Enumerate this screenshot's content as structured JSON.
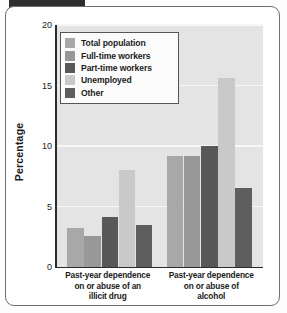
{
  "figure": {
    "frame_border_color": "#6f6f6f",
    "tab_color": "#2e2e2e",
    "plot_background": "#e4e4e4",
    "gridline_color": "#f7f7f7",
    "axis_color": "#2b2b2b"
  },
  "chart_data": {
    "type": "bar",
    "title": "",
    "xlabel": "",
    "ylabel": "Percentage",
    "ylim": [
      0,
      20
    ],
    "yticks": [
      0,
      5,
      10,
      15,
      20
    ],
    "ytick_labels": [
      "0",
      "5",
      "10",
      "15",
      "20"
    ],
    "grid": true,
    "legend_position": "upper left",
    "categories": [
      "Past-year dependence on or abuse of an illicit drug",
      "Past-year dependence on or abuse of alcohol"
    ],
    "category_lines": [
      [
        "Past-year dependence",
        "on or abuse of an",
        "illicit drug"
      ],
      [
        "Past-year dependence",
        "on or abuse of",
        "alcohol"
      ]
    ],
    "series": [
      {
        "name": "Total population",
        "color": "#a8a8a8",
        "values": [
          3.2,
          9.2
        ]
      },
      {
        "name": "Full-time workers",
        "color": "#989898",
        "values": [
          2.6,
          9.2
        ]
      },
      {
        "name": "Part-time workers",
        "color": "#585858",
        "values": [
          4.1,
          10.0
        ]
      },
      {
        "name": "Unemployed",
        "color": "#c9c9c9",
        "values": [
          8.0,
          15.6
        ]
      },
      {
        "name": "Other",
        "color": "#5e5e5e",
        "values": [
          3.5,
          6.5
        ]
      }
    ]
  }
}
